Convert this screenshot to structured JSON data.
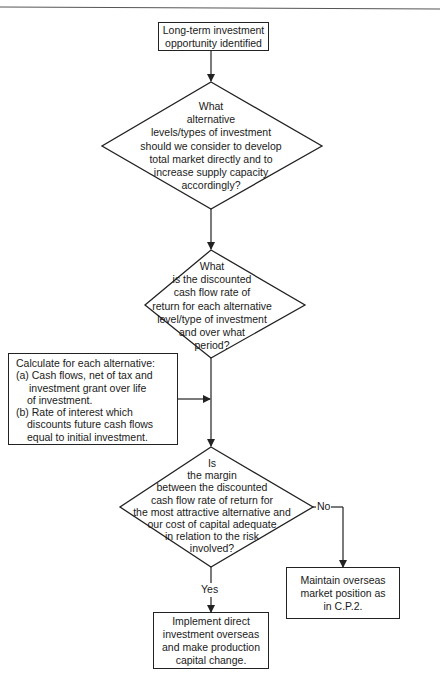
{
  "flowchart": {
    "start": {
      "lines": [
        "Long-term investment",
        "opportunity identified"
      ]
    },
    "decision_1": {
      "lines": [
        "What",
        "alternative",
        "levels/types of investment",
        "should we consider to develop",
        "total market directly and to",
        "increase supply capacity",
        "accordingly?"
      ]
    },
    "decision_2": {
      "lines": [
        "What",
        "is the discounted",
        "cash flow rate of",
        "return for each alternative",
        "level/type of investment",
        "and over what",
        "period?"
      ]
    },
    "calculation_note": {
      "title": "Calculate for each alternative:",
      "items": [
        {
          "marker": "(a)",
          "lines": [
            "Cash flows, net of tax and",
            "investment grant over life",
            "of investment."
          ]
        },
        {
          "marker": "(b)",
          "lines": [
            "Rate of interest which",
            "discounts future cash flows",
            "equal to initial investment."
          ]
        }
      ]
    },
    "decision_3": {
      "lines": [
        "Is",
        "the margin",
        "between the discounted",
        "cash flow rate of return for",
        "the most attractive alternative and",
        "our cost of capital adequate",
        "in relation to the risk",
        "involved?"
      ]
    },
    "branch_labels": {
      "no": "No",
      "yes": "Yes"
    },
    "outcome_no": {
      "lines": [
        "Maintain overseas",
        "market position as",
        "in C.P.2."
      ]
    },
    "outcome_yes": {
      "lines": [
        "Implement direct",
        "investment overseas",
        "and make production",
        "capital change."
      ]
    }
  }
}
